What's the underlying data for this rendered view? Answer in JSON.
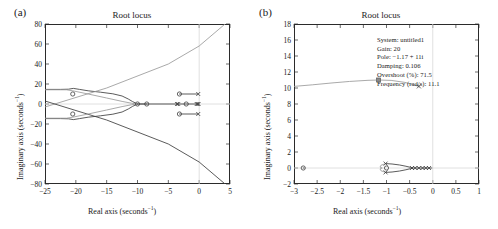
{
  "figure": {
    "panels": [
      {
        "label": "(a)",
        "title": "Root locus",
        "xlabel_text": "Real axis (seconds",
        "xlabel_sup": "−1",
        "xlabel_tail": ")",
        "ylabel_text": "Imaginary axis (seconds",
        "ylabel_sup": "−1",
        "ylabel_tail": ")"
      },
      {
        "label": "(b)",
        "title": "Root locus",
        "xlabel_text": "Real axis (seconds",
        "xlabel_sup": "−1",
        "xlabel_tail": ")",
        "ylabel_text": "Imaginary axis (seconds",
        "ylabel_sup": "−1",
        "ylabel_tail": ")"
      }
    ],
    "datatip": {
      "system": "System: untitled1",
      "gain": "Gain: 20",
      "pole": "Pole: −1.17 + 11i",
      "damping": "Damping: 0.106",
      "overshoot": "Overshoot (%): 71.5",
      "frequency": "Frequency (rad/s): 11.1"
    },
    "colors": {
      "axis": "#2b2b2b",
      "locus_dark": "#3d3d3d",
      "locus_light": "#9a9a9a",
      "grid": "#cfcfcf",
      "text": "#1a1a1a"
    }
  },
  "chart_data": [
    {
      "type": "line",
      "title": "Root locus",
      "panel": "(a)",
      "xlabel": "Real axis (seconds^-1)",
      "ylabel": "Imaginary axis (seconds^-1)",
      "xlim": [
        -25,
        5
      ],
      "ylim": [
        -80,
        80
      ],
      "xticks": [
        -25,
        -20,
        -15,
        -10,
        -5,
        0,
        5
      ],
      "yticks": [
        -80,
        -60,
        -40,
        -20,
        0,
        20,
        40,
        60,
        80
      ],
      "grid": false,
      "legend": "none",
      "markers": {
        "zeros": [
          [
            -20.5,
            10.0
          ],
          [
            -20.5,
            -10.0
          ],
          [
            -3.2,
            10.0
          ],
          [
            -3.2,
            -10.0
          ],
          [
            -2.1,
            0.0
          ],
          [
            -10.0,
            0.0
          ],
          [
            -8.5,
            0.0
          ]
        ],
        "poles": [
          [
            -0.15,
            10.0
          ],
          [
            -0.15,
            -10.0
          ],
          [
            -0.4,
            0.0
          ],
          [
            -0.25,
            0.0
          ],
          [
            -0.1,
            0.0
          ],
          [
            -3.4,
            0.0
          ],
          [
            -3.6,
            0.0
          ]
        ]
      },
      "series": [
        {
          "name": "branch-upper-dark",
          "comment": "dark locus from (-25,14.5) through zero at -20.5 bending to real axis near -10",
          "points": [
            [
              -25,
              14.6
            ],
            [
              -22.5,
              14.6
            ],
            [
              -21.2,
              14.8
            ],
            [
              -20.4,
              15.6
            ],
            [
              -19.4,
              14.6
            ],
            [
              -18.0,
              13.2
            ],
            [
              -16.0,
              11.8
            ],
            [
              -14.0,
              10.2
            ],
            [
              -12.5,
              8.0
            ],
            [
              -11.5,
              5.0
            ],
            [
              -10.8,
              2.4
            ],
            [
              -10.2,
              0.6
            ],
            [
              -10.0,
              0.0
            ]
          ]
        },
        {
          "name": "branch-lower-dark",
          "points": [
            [
              -25,
              -14.6
            ],
            [
              -22.5,
              -14.6
            ],
            [
              -21.2,
              -14.8
            ],
            [
              -20.4,
              -15.6
            ],
            [
              -19.4,
              -14.6
            ],
            [
              -18.0,
              -13.2
            ],
            [
              -16.0,
              -11.8
            ],
            [
              -14.0,
              -10.2
            ],
            [
              -12.5,
              -8.0
            ],
            [
              -11.5,
              -5.0
            ],
            [
              -10.8,
              -2.4
            ],
            [
              -10.2,
              -0.6
            ],
            [
              -10.0,
              0.0
            ]
          ]
        },
        {
          "name": "asymptote-upper-light",
          "points": [
            [
              -25,
              -3.0
            ],
            [
              -15,
              16.0
            ],
            [
              -5,
              40.0
            ],
            [
              0,
              58.0
            ],
            [
              4.2,
              80.0
            ]
          ]
        },
        {
          "name": "asymptote-lower-dark",
          "points": [
            [
              -25,
              3.0
            ],
            [
              -15,
              -16.0
            ],
            [
              -5,
              -40.0
            ],
            [
              0,
              -58.0
            ],
            [
              4.2,
              -80.0
            ]
          ]
        },
        {
          "name": "light-branch-upper",
          "points": [
            [
              -25,
              14.2
            ],
            [
              -21.5,
              14.2
            ],
            [
              -20.5,
              13.2
            ],
            [
              -18.0,
              10.0
            ],
            [
              -15.0,
              6.0
            ],
            [
              -12.5,
              2.6
            ],
            [
              -11.0,
              0.8
            ],
            [
              -10.0,
              0.0
            ],
            [
              -8.5,
              0.0
            ]
          ]
        },
        {
          "name": "light-branch-lower",
          "points": [
            [
              -25,
              -14.2
            ],
            [
              -21.5,
              -14.2
            ],
            [
              -20.5,
              -13.2
            ],
            [
              -18.0,
              -10.0
            ],
            [
              -15.0,
              -6.0
            ],
            [
              -12.5,
              -2.6
            ],
            [
              -11.0,
              -0.8
            ],
            [
              -10.0,
              0.0
            ],
            [
              -8.5,
              0.0
            ]
          ]
        },
        {
          "name": "real-axis-segment",
          "points": [
            [
              -10.0,
              0.0
            ],
            [
              -0.05,
              0.0
            ]
          ]
        },
        {
          "name": "segment-upper-tip",
          "points": [
            [
              -3.2,
              10.0
            ],
            [
              -0.15,
              10.0
            ]
          ]
        },
        {
          "name": "segment-lower-tip",
          "points": [
            [
              -3.2,
              -10.0
            ],
            [
              -0.15,
              -10.0
            ]
          ]
        }
      ]
    },
    {
      "type": "line",
      "title": "Root locus",
      "panel": "(b)",
      "xlabel": "Real axis (seconds^-1)",
      "ylabel": "Imaginary axis (seconds^-1)",
      "xlim": [
        -3,
        1
      ],
      "ylim": [
        -2,
        18
      ],
      "xticks": [
        -3,
        -2.5,
        -2,
        -1.5,
        -1,
        -0.5,
        0,
        0.5,
        1
      ],
      "yticks": [
        -2,
        0,
        2,
        4,
        6,
        8,
        10,
        12,
        14,
        16,
        18
      ],
      "grid": false,
      "legend": "none",
      "annotation": {
        "system": "untitled1",
        "gain": 20,
        "pole_real": -1.17,
        "pole_imag": 11,
        "damping": 0.106,
        "overshoot_pct": 71.5,
        "frequency_rad_s": 11.1
      },
      "markers": {
        "zeros": [
          [
            -2.8,
            0.0
          ],
          [
            -1.0,
            0.0
          ]
        ],
        "poles": [
          [
            -0.3,
            10.2
          ],
          [
            -1.02,
            0.55
          ],
          [
            -1.02,
            -0.55
          ],
          [
            -0.45,
            0.0
          ],
          [
            -0.38,
            0.0
          ],
          [
            -0.3,
            0.0
          ],
          [
            -0.22,
            0.0
          ],
          [
            -0.15,
            0.0
          ],
          [
            -0.08,
            0.0
          ]
        ],
        "datatip_square": [
          -1.17,
          11.0
        ]
      },
      "series": [
        {
          "name": "upper-branch",
          "points": [
            [
              -3.0,
              10.2
            ],
            [
              -2.6,
              10.4
            ],
            [
              -2.2,
              10.62
            ],
            [
              -1.8,
              10.82
            ],
            [
              -1.4,
              10.96
            ],
            [
              -1.17,
              11.0
            ],
            [
              -0.9,
              10.95
            ],
            [
              -0.6,
              10.7
            ],
            [
              -0.3,
              10.2
            ]
          ]
        },
        {
          "name": "breakaway-loop-upper",
          "points": [
            [
              -1.02,
              0.55
            ],
            [
              -0.88,
              0.5
            ],
            [
              -0.72,
              0.38
            ],
            [
              -0.58,
              0.22
            ],
            [
              -0.48,
              0.08
            ],
            [
              -0.44,
              0.0
            ]
          ]
        },
        {
          "name": "breakaway-loop-lower",
          "points": [
            [
              -1.02,
              -0.55
            ],
            [
              -0.88,
              -0.5
            ],
            [
              -0.72,
              -0.38
            ],
            [
              -0.58,
              -0.22
            ],
            [
              -0.48,
              -0.08
            ],
            [
              -0.44,
              0.0
            ]
          ]
        },
        {
          "name": "loop-left-arc-upper",
          "points": [
            [
              -1.02,
              0.55
            ],
            [
              -1.12,
              0.34
            ],
            [
              -1.14,
              0.12
            ],
            [
              -1.1,
              0.0
            ]
          ]
        },
        {
          "name": "loop-left-arc-lower",
          "points": [
            [
              -1.02,
              -0.55
            ],
            [
              -1.12,
              -0.34
            ],
            [
              -1.14,
              -0.12
            ],
            [
              -1.1,
              0.0
            ]
          ]
        },
        {
          "name": "real-axis-right-segment",
          "points": [
            [
              -0.46,
              0.0
            ],
            [
              -0.02,
              0.0
            ]
          ]
        },
        {
          "name": "real-axis-left-dot",
          "points": [
            [
              -2.8,
              0.0
            ],
            [
              -2.78,
              0.0
            ]
          ]
        }
      ]
    }
  ]
}
